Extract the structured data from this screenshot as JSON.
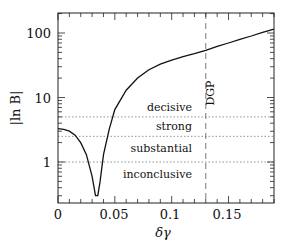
{
  "chart_data": {
    "type": "line",
    "title": "",
    "xlabel": "δγ",
    "ylabel": "|ln B|",
    "xlim": [
      0,
      0.19
    ],
    "ylim": [
      0.3,
      200
    ],
    "yscale": "log",
    "xticks": [
      0,
      0.05,
      0.1,
      0.15
    ],
    "xtick_labels": [
      "0",
      "0.05",
      "0.1",
      "0.15"
    ],
    "yticks": [
      1,
      10,
      100
    ],
    "ytick_labels": [
      "1",
      "10",
      "100"
    ],
    "grid": false,
    "legend": null,
    "series": [
      {
        "name": "|ln B|",
        "style": "solid",
        "x": [
          0,
          0.005,
          0.01,
          0.015,
          0.02,
          0.025,
          0.03,
          0.033,
          0.035,
          0.037,
          0.04,
          0.045,
          0.05,
          0.06,
          0.07,
          0.08,
          0.09,
          0.1,
          0.11,
          0.12,
          0.13,
          0.14,
          0.15,
          0.16,
          0.17,
          0.18,
          0.19
        ],
        "y": [
          3.3,
          3.2,
          3.0,
          2.6,
          2.0,
          1.3,
          0.6,
          0.3,
          0.3,
          0.5,
          1.3,
          3.2,
          6.5,
          13,
          20,
          27,
          33,
          38,
          43,
          48,
          54,
          62,
          70,
          80,
          90,
          102,
          115
        ]
      }
    ],
    "hlines": [
      {
        "y": 5,
        "style": "dotted",
        "label": "decisive"
      },
      {
        "y": 2.5,
        "style": "dotted",
        "label": "strong"
      },
      {
        "y": 1,
        "style": "dotted",
        "label": "substantial"
      },
      {
        "y": 0.3,
        "style": "none",
        "label": "inconclusive"
      }
    ],
    "vlines": [
      {
        "x": 0.13,
        "style": "dashed",
        "label": "DGP"
      }
    ],
    "annotations": [
      "decisive",
      "strong",
      "substantial",
      "inconclusive",
      "DGP"
    ]
  },
  "labels": {
    "x_axis": "δγ",
    "y_axis": "|ln B|",
    "dgp": "DGP",
    "decisive": "decisive",
    "strong": "strong",
    "substantial": "substantial",
    "inconclusive": "inconclusive",
    "xt0": "0",
    "xt1": "0.05",
    "xt2": "0.1",
    "xt3": "0.15",
    "yt0": "1",
    "yt1": "10",
    "yt2": "100"
  }
}
